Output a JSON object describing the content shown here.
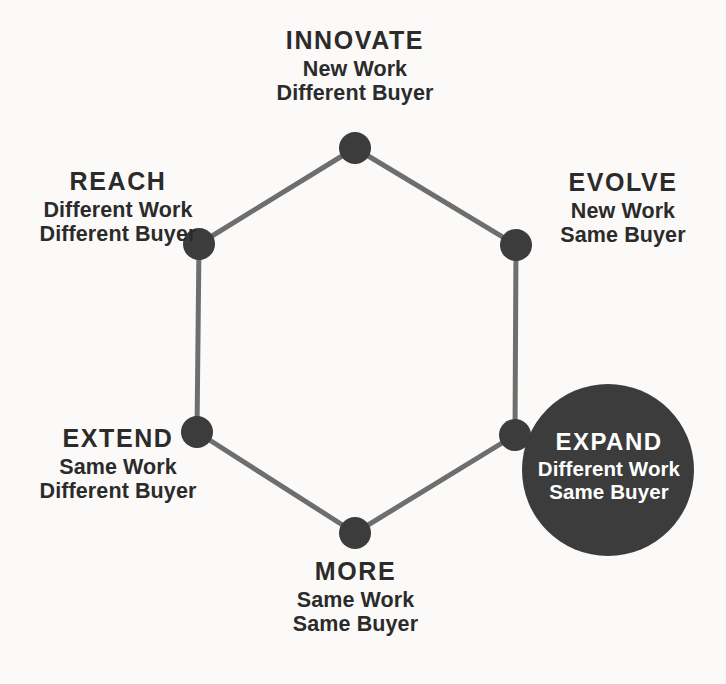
{
  "diagram": {
    "type": "hexagon-growth-matrix",
    "background_color": "#fbfaf8",
    "line_color": "#6e6e6e",
    "node_color": "#3c3c3c",
    "highlight_color": "#3c3c3c",
    "highlight_text_color": "#ffffff",
    "text_color": "#2b2b2b",
    "highlighted_node": "EXPAND",
    "nodes": [
      {
        "id": "innovate",
        "title": "INNOVATE",
        "line1": "New Work",
        "line2": "Different Buyer",
        "position": "top",
        "cx": 355,
        "cy": 148,
        "highlighted": false
      },
      {
        "id": "evolve",
        "title": "EVOLVE",
        "line1": "New Work",
        "line2": "Same Buyer",
        "position": "upper-right",
        "cx": 516,
        "cy": 245,
        "highlighted": false
      },
      {
        "id": "expand",
        "title": "EXPAND",
        "line1": "Different Work",
        "line2": "Same Buyer",
        "position": "lower-right",
        "cx": 515,
        "cy": 435,
        "highlighted": true
      },
      {
        "id": "more",
        "title": "MORE",
        "line1": "Same Work",
        "line2": "Same Buyer",
        "position": "bottom",
        "cx": 355,
        "cy": 533,
        "highlighted": false
      },
      {
        "id": "extend",
        "title": "EXTEND",
        "line1": "Same Work",
        "line2": "Different Buyer",
        "position": "lower-left",
        "cx": 197,
        "cy": 432,
        "highlighted": false
      },
      {
        "id": "reach",
        "title": "REACH",
        "line1": "Different Work",
        "line2": "Different Buyer",
        "position": "upper-left",
        "cx": 199,
        "cy": 244,
        "highlighted": false
      }
    ],
    "highlight_circle": {
      "cx": 608,
      "cy": 470,
      "r": 86
    }
  }
}
